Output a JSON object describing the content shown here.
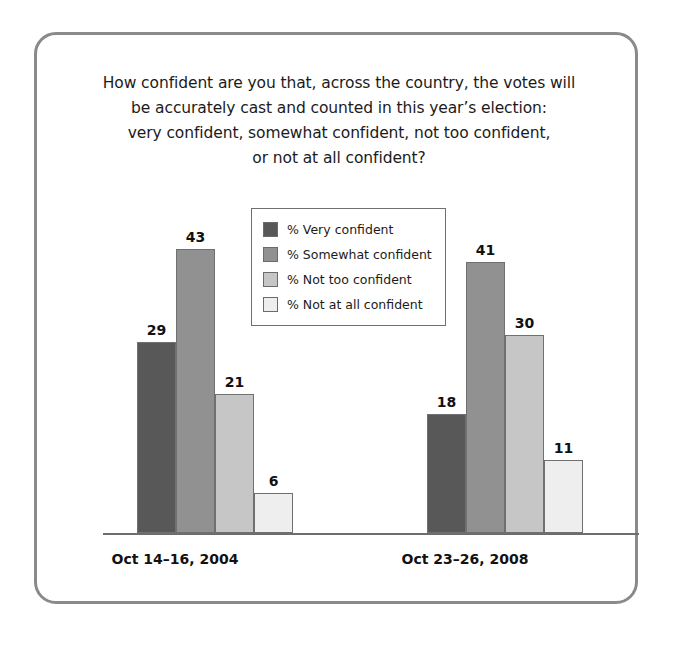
{
  "figure": {
    "title_lines": [
      "How confident are you that, across the country, the votes will",
      "be accurately cast and counted in this year’s election:",
      "very confident, somewhat confident, not too confident,",
      "or not at all confident?"
    ]
  },
  "chart_data": {
    "type": "bar",
    "xlabel": "",
    "ylabel": "",
    "ylim": [
      0,
      50
    ],
    "grid": false,
    "legend_position": "top-center",
    "categories": [
      "Oct 14–16, 2004",
      "Oct 23–26, 2008"
    ],
    "series": [
      {
        "name": "% Very confident",
        "color": "#585858",
        "values": [
          29,
          43
        ]
      },
      {
        "name": "% Somewhat confident",
        "color": "#919191",
        "values": [
          43,
          41
        ]
      },
      {
        "name": "% Not too confident",
        "color": "#c6c6c6",
        "values": [
          21,
          30
        ]
      },
      {
        "name": "% Not at all confident",
        "color": "#eeeeee",
        "values": [
          6,
          11
        ]
      }
    ],
    "groups": [
      {
        "category": "Oct 14–16, 2004",
        "bars": [
          {
            "label": "% Very confident",
            "value": 29,
            "color": "#585858"
          },
          {
            "label": "% Somewhat confident",
            "value": 43,
            "color": "#919191"
          },
          {
            "label": "% Not too confident",
            "value": 21,
            "color": "#c6c6c6"
          },
          {
            "label": "% Not at all confident",
            "value": 6,
            "color": "#eeeeee"
          }
        ]
      },
      {
        "category": "Oct 23–26, 2008",
        "bars": [
          {
            "label": "% Very confident",
            "value": 18,
            "color": "#585858"
          },
          {
            "label": "% Somewhat confident",
            "value": 41,
            "color": "#919191"
          },
          {
            "label": "% Not too confident",
            "value": 30,
            "color": "#c6c6c6"
          },
          {
            "label": "% Not at all confident",
            "value": 11,
            "color": "#eeeeee"
          }
        ]
      }
    ]
  }
}
